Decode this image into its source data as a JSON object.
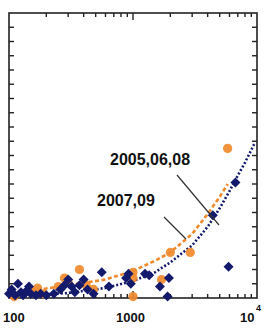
{
  "chart_data": {
    "type": "scatter",
    "title": "",
    "xlabel": "",
    "ylabel": "",
    "x_scale": "log",
    "xlim": [
      100,
      10000
    ],
    "ylim": [
      0,
      20
    ],
    "y_units": "unlabeled (tick units)",
    "grid": false,
    "legend": null,
    "x_tick_labels": [
      "100",
      "1000",
      "10^4"
    ],
    "annotations": [
      {
        "text": "2005,06,08",
        "points_to": "navy dotted fit"
      },
      {
        "text": "2007,09",
        "points_to": "orange dashed fit"
      }
    ],
    "series": [
      {
        "name": "2005,06,08",
        "marker": "diamond",
        "color": "#141a6b",
        "points": [
          [
            100,
            0.3
          ],
          [
            105,
            0.6
          ],
          [
            112,
            0.2
          ],
          [
            118,
            1.0
          ],
          [
            125,
            0.4
          ],
          [
            130,
            0.2
          ],
          [
            138,
            0.5
          ],
          [
            145,
            0.8
          ],
          [
            150,
            0.3
          ],
          [
            165,
            0.2
          ],
          [
            180,
            0.3
          ],
          [
            200,
            0.2
          ],
          [
            230,
            0.3
          ],
          [
            260,
            0.6
          ],
          [
            280,
            0.9
          ],
          [
            300,
            1.3
          ],
          [
            320,
            0.8
          ],
          [
            340,
            0.4
          ],
          [
            370,
            0.9
          ],
          [
            400,
            1.3
          ],
          [
            430,
            0.6
          ],
          [
            480,
            0.3
          ],
          [
            560,
            1.8
          ],
          [
            640,
            0.8
          ],
          [
            880,
            1.4
          ],
          [
            920,
            1.7
          ],
          [
            960,
            1.0
          ],
          [
            1250,
            1.7
          ],
          [
            1350,
            1.6
          ],
          [
            1650,
            0.8
          ],
          [
            1900,
            0.1
          ],
          [
            1950,
            1.4
          ],
          [
            4400,
            5.8
          ],
          [
            5900,
            2.2
          ],
          [
            6700,
            8.1
          ]
        ]
      },
      {
        "name": "2007,09",
        "marker": "circle",
        "color": "#f08a2c",
        "points": [
          [
            110,
            0.1
          ],
          [
            150,
            0.5
          ],
          [
            170,
            0.7
          ],
          [
            190,
            0.3
          ],
          [
            250,
            0.8
          ],
          [
            280,
            1.4
          ],
          [
            300,
            1.1
          ],
          [
            370,
            2.0
          ],
          [
            420,
            0.9
          ],
          [
            480,
            0.6
          ],
          [
            1000,
            1.8
          ],
          [
            1000,
            0.1
          ],
          [
            1000,
            1.4
          ],
          [
            1700,
            1.3
          ],
          [
            2000,
            3.2
          ],
          [
            2900,
            3.2
          ],
          [
            5800,
            10.5
          ]
        ]
      }
    ],
    "fits": [
      {
        "name": "2005,06,08 fit",
        "style": "dotted",
        "color": "#141a6b",
        "points": [
          [
            100,
            0.1
          ],
          [
            300,
            0.35
          ],
          [
            600,
            0.7
          ],
          [
            1000,
            1.2
          ],
          [
            1500,
            1.8
          ],
          [
            2000,
            2.5
          ],
          [
            3000,
            3.7
          ],
          [
            4000,
            5.0
          ],
          [
            5000,
            6.3
          ],
          [
            6000,
            7.5
          ],
          [
            7000,
            8.6
          ],
          [
            8000,
            9.5
          ],
          [
            9500,
            10.8
          ]
        ]
      },
      {
        "name": "2007,09 fit",
        "style": "dashed",
        "color": "#f08a2c",
        "points": [
          [
            150,
            0.5
          ],
          [
            300,
            0.9
          ],
          [
            600,
            1.3
          ],
          [
            1000,
            1.9
          ],
          [
            1500,
            2.6
          ],
          [
            2000,
            3.2
          ],
          [
            3000,
            4.5
          ],
          [
            4000,
            5.9
          ],
          [
            5000,
            7.1
          ],
          [
            5800,
            8.0
          ]
        ]
      }
    ]
  }
}
